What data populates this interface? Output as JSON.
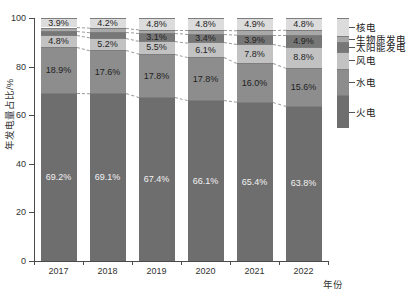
{
  "chart_data": {
    "type": "bar",
    "stacked": true,
    "title": "",
    "xlabel": "年份",
    "ylabel": "年发电量占比/%",
    "categories": [
      "2017",
      "2018",
      "2019",
      "2020",
      "2021",
      "2022"
    ],
    "ylim": [
      0,
      100
    ],
    "yticks": [
      "0",
      "20",
      "40",
      "60",
      "80",
      "100"
    ],
    "grid": false,
    "legend_position": "right",
    "series": [
      {
        "name": "火电",
        "color": "#6e6e6e",
        "values": [
          69.2,
          69.1,
          67.4,
          66.1,
          65.4,
          63.8
        ],
        "labels": [
          "69.2%",
          "69.1%",
          "67.4%",
          "66.1%",
          "65.4%",
          "63.8%"
        ]
      },
      {
        "name": "水电",
        "color": "#8d8d8d",
        "values": [
          18.9,
          17.6,
          17.8,
          17.8,
          16.0,
          15.6
        ],
        "labels": [
          "18.9%",
          "17.6%",
          "17.8%",
          "17.8%",
          "16.0%",
          "15.6%"
        ]
      },
      {
        "name": "风电",
        "color": "#c2c2c2",
        "values": [
          4.8,
          5.2,
          5.5,
          6.1,
          7.8,
          8.8
        ],
        "labels": [
          "4.8%",
          "5.2%",
          "5.5%",
          "6.1%",
          "7.8%",
          "8.8%"
        ]
      },
      {
        "name": "太阳能发电",
        "color": "#777777",
        "values": [
          1.8,
          2.3,
          3.1,
          3.4,
          3.9,
          4.9
        ],
        "labels": [
          "",
          "",
          "3.1%",
          "3.4%",
          "3.9%",
          "4.9%"
        ]
      },
      {
        "name": "生物质发电",
        "color": "#a8a8a8",
        "values": [
          1.4,
          1.6,
          1.4,
          1.8,
          2.0,
          2.1
        ],
        "labels": [
          "",
          "",
          "",
          "",
          "",
          ""
        ]
      },
      {
        "name": "核电",
        "color": "#dcdcdc",
        "values": [
          3.9,
          4.2,
          4.8,
          4.8,
          4.9,
          4.8
        ],
        "labels": [
          "3.9%",
          "4.2%",
          "4.8%",
          "4.8%",
          "4.9%",
          "4.8%"
        ]
      }
    ]
  },
  "legend": {
    "items": [
      {
        "label": "核电",
        "color": "#dcdcdc"
      },
      {
        "label": "生物质发电",
        "color": "#a8a8a8"
      },
      {
        "label": "太阳能发电",
        "color": "#777777"
      },
      {
        "label": "风电",
        "color": "#c2c2c2"
      },
      {
        "label": "水电",
        "color": "#8d8d8d"
      },
      {
        "label": "火电",
        "color": "#6e6e6e"
      }
    ]
  }
}
